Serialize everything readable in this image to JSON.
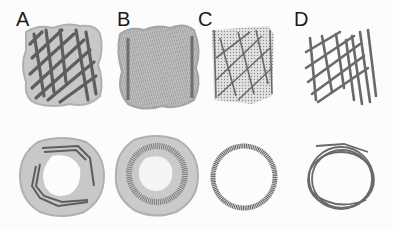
{
  "figure": {
    "panels": [
      {
        "label": "A",
        "side_view": "surface with strands",
        "top_view": "ring surface with strands"
      },
      {
        "label": "B",
        "side_view": "dense surface mesh",
        "top_view": "thick ring mesh"
      },
      {
        "label": "C",
        "side_view": "dotted mesh with strands",
        "top_view": "thin dotted ring"
      },
      {
        "label": "D",
        "side_view": "ribbon strands",
        "top_view": "ribbon ring"
      }
    ]
  },
  "colors": {
    "surface": "#c4c4c4",
    "surface_edge": "#a8a8a8",
    "strand": "#5a5a5a",
    "mesh": "#7a7a7a",
    "background": "#fcfcfc"
  }
}
